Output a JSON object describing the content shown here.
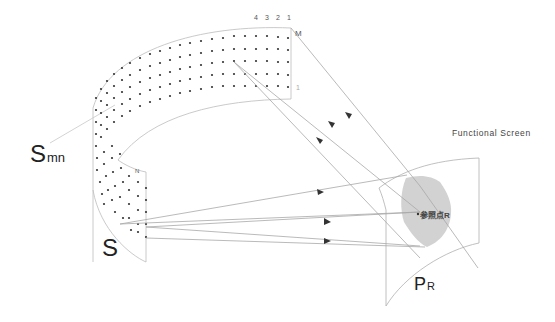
{
  "diagram": {
    "labels": {
      "source_surface": "S",
      "element_main": "S",
      "element_sub": "mn",
      "screen_title": "Functional Screen",
      "reference_point": "参照点R",
      "projection_main": "P",
      "projection_sub": "R",
      "row_label_top": "M",
      "row_label_bottom": "N",
      "column_numbers": [
        "4",
        "3",
        "2",
        "1"
      ],
      "side_marker": "1"
    },
    "colors": {
      "line": "#b5b5b5",
      "dot": "#333333",
      "target_fill": "#d2d2d2",
      "arrow": "#333333",
      "text": "#333333"
    }
  }
}
